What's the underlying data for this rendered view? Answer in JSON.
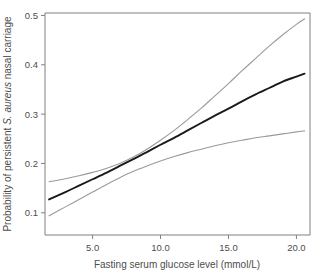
{
  "chart_data": {
    "type": "line",
    "title": "",
    "xlabel": "Fasting serum glucose level (mmol/L)",
    "ylabel_prefix": "Probability of persistent ",
    "ylabel_italic": "S. aureus",
    "ylabel_suffix": " nasal carriage",
    "ylabel_full": "Probability of persistent S. aureus nasal carriage",
    "xlim": [
      1.5,
      21.0
    ],
    "ylim": [
      0.055,
      0.505
    ],
    "xticks": [
      5.0,
      10.0,
      15.0,
      20.0
    ],
    "xticklabels": [
      "5.0",
      "10.0",
      "15.0",
      "20.0"
    ],
    "yticks": [
      0.1,
      0.2,
      0.3,
      0.4,
      0.5
    ],
    "yticklabels": [
      "0.1",
      "0.2",
      "0.3",
      "0.4",
      "0.5"
    ],
    "grid": false,
    "legend": "none",
    "colors": {
      "fit_line": "#1a1a1a",
      "confidence_band": "#9a9a9a",
      "axis": "#808080",
      "text": "#4d4d4d",
      "background": "#ffffff"
    },
    "x": [
      1.8,
      3.0,
      4.0,
      5.0,
      6.0,
      7.0,
      8.0,
      9.0,
      10.0,
      11.0,
      12.0,
      13.0,
      14.0,
      15.0,
      16.0,
      17.0,
      18.0,
      19.0,
      20.0,
      20.6
    ],
    "series": [
      {
        "name": "Fitted probability",
        "style": "solid-dark",
        "values": [
          0.127,
          0.142,
          0.155,
          0.168,
          0.181,
          0.195,
          0.209,
          0.223,
          0.238,
          0.252,
          0.267,
          0.282,
          0.297,
          0.311,
          0.326,
          0.34,
          0.353,
          0.366,
          0.376,
          0.382
        ]
      },
      {
        "name": "Upper 95% confidence limit",
        "style": "solid-gray",
        "values": [
          0.163,
          0.169,
          0.175,
          0.182,
          0.19,
          0.2,
          0.213,
          0.229,
          0.247,
          0.267,
          0.289,
          0.312,
          0.337,
          0.362,
          0.388,
          0.413,
          0.438,
          0.461,
          0.482,
          0.493
        ]
      },
      {
        "name": "Lower 95% confidence limit",
        "style": "solid-gray",
        "values": [
          0.094,
          0.112,
          0.127,
          0.142,
          0.157,
          0.171,
          0.184,
          0.195,
          0.205,
          0.214,
          0.222,
          0.229,
          0.236,
          0.242,
          0.247,
          0.252,
          0.256,
          0.26,
          0.264,
          0.266
        ]
      }
    ]
  }
}
